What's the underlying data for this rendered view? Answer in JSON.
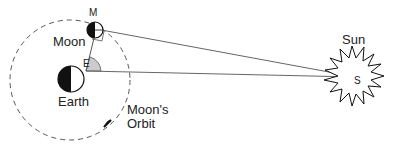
{
  "diagram": {
    "type": "astronomy-geometry",
    "labels": {
      "moon": "Moon",
      "moon_point": "M",
      "earth": "Earth",
      "earth_point": "E",
      "sun": "Sun",
      "sun_point": "S",
      "orbit_line1": "Moon's",
      "orbit_line2": "Orbit"
    },
    "colors": {
      "line": "#555555",
      "angle_fill": "#cccccc",
      "dark": "#111111"
    }
  }
}
